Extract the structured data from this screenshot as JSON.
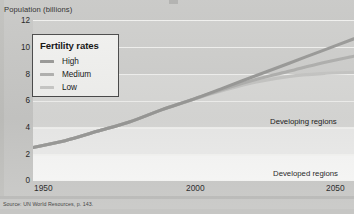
{
  "chart_data": {
    "type": "line",
    "title": "",
    "ylabel": "Population (billions)",
    "xlabel": "",
    "ylim": [
      0,
      12
    ],
    "xlim": [
      1950,
      2050
    ],
    "yticks": [
      0,
      2,
      4,
      6,
      8,
      10,
      12
    ],
    "xticks": [
      1950,
      2000,
      2050
    ],
    "grid": true,
    "legend_position": "upper-left",
    "legend_title": "Fertility rates",
    "x": [
      1950,
      1960,
      1970,
      1980,
      1990,
      2000,
      2010,
      2020,
      2030,
      2040,
      2050
    ],
    "series": [
      {
        "name": "High",
        "color": "#9a9a98",
        "values": [
          2.5,
          3.0,
          3.7,
          4.4,
          5.3,
          6.1,
          7.0,
          7.9,
          8.8,
          9.7,
          10.6
        ]
      },
      {
        "name": "Medium",
        "color": "#b0b0ae",
        "values": [
          2.5,
          3.0,
          3.7,
          4.4,
          5.3,
          6.1,
          6.9,
          7.6,
          8.2,
          8.8,
          9.3
        ]
      },
      {
        "name": "Low",
        "color": "#c6c6c4",
        "values": [
          2.5,
          3.0,
          3.7,
          4.4,
          5.3,
          6.1,
          6.8,
          7.4,
          7.8,
          8.0,
          8.1
        ]
      }
    ],
    "annotations": [
      {
        "text": "Developing regions",
        "x": 2035,
        "y": 4.3
      },
      {
        "text": "Developed regions",
        "x": 2035,
        "y": 1.2
      }
    ]
  },
  "legend": {
    "title": "Fertility rates",
    "items": [
      {
        "label": "High",
        "color": "#9a9a98"
      },
      {
        "label": "Medium",
        "color": "#b2b2b0"
      },
      {
        "label": "Low",
        "color": "#c9c9c7"
      }
    ]
  },
  "axes": {
    "y_title": "Population (billions)",
    "y_ticks": [
      "12",
      "10",
      "8",
      "6",
      "4",
      "2",
      "0"
    ],
    "x_ticks": [
      "1950",
      "2000",
      "2050"
    ]
  },
  "annotations": {
    "developing": "Developing regions",
    "developed": "Developed regions"
  },
  "footer": {
    "source": "Source: UN World Resources, p. 143."
  }
}
